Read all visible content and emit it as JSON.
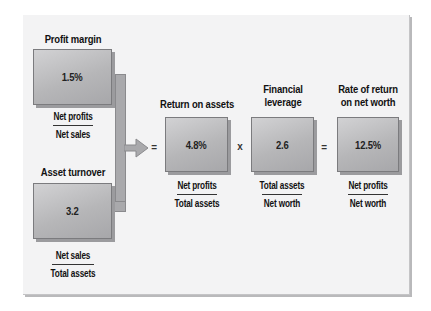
{
  "diagram": {
    "colors": {
      "background": "#f3f3f4",
      "box_fill_light": "#d2d2d4",
      "box_fill_dark": "#a7a7aa",
      "box_border": "#7b7b7e",
      "connector": "#a9a9ac",
      "text": "#111111"
    },
    "nodes": {
      "profit_margin": {
        "label": "Profit margin",
        "value": "1.5%",
        "numerator": "Net profits",
        "denominator": "Net sales"
      },
      "asset_turnover": {
        "label": "Asset turnover",
        "value": "3.2",
        "numerator": "Net sales",
        "denominator": "Total assets"
      },
      "return_on_assets": {
        "label": "Return on assets",
        "value": "4.8%",
        "numerator": "Net profits",
        "denominator": "Total assets"
      },
      "financial_leverage": {
        "label_line1": "Financial",
        "label_line2": "leverage",
        "value": "2.6",
        "numerator": "Total assets",
        "denominator": "Net worth"
      },
      "rate_of_return": {
        "label_line1": "Rate of return",
        "label_line2": "on net worth",
        "value": "12.5%",
        "numerator": "Net profits",
        "denominator": "Net worth"
      }
    },
    "operators": {
      "eq1": "=",
      "times": "x",
      "eq2": "="
    },
    "edges": [
      {
        "from": "profit_margin",
        "to": "return_on_assets",
        "type": "bracket-arrow"
      },
      {
        "from": "asset_turnover",
        "to": "return_on_assets",
        "type": "bracket-arrow"
      }
    ]
  }
}
